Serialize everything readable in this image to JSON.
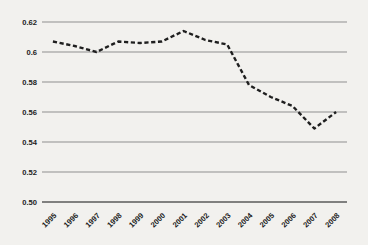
{
  "chart_data": {
    "type": "line",
    "title": "",
    "xlabel": "",
    "ylabel": "",
    "categories": [
      "1995",
      "1996",
      "1997",
      "1998",
      "1999",
      "2000",
      "2001",
      "2002",
      "2003",
      "2004",
      "2005",
      "2006",
      "2007",
      "2008"
    ],
    "series": [
      {
        "name": "dashed-trend",
        "values": [
          0.607,
          0.604,
          0.6,
          0.607,
          0.606,
          0.607,
          0.614,
          0.608,
          0.605,
          0.578,
          0.57,
          0.564,
          0.549,
          0.56
        ]
      }
    ],
    "ylim": [
      0.5,
      0.62
    ],
    "y_ticks": [
      {
        "value": 0.62,
        "label": "0.62"
      },
      {
        "value": 0.6,
        "label": "0.6"
      },
      {
        "value": 0.58,
        "label": "0.58"
      },
      {
        "value": 0.56,
        "label": "0.56"
      },
      {
        "value": 0.54,
        "label": "0.54"
      },
      {
        "value": 0.52,
        "label": "0.52"
      },
      {
        "value": 0.5,
        "label": "0.50"
      }
    ],
    "grid": "horizontal",
    "legend": "none",
    "line_style": "dashed",
    "x_tick_rotation": -45,
    "colors": {
      "line": "#1f1f1f",
      "gridline": "#8f8f8f",
      "baseline": "#5a5a5a",
      "background": "#f2f1ee",
      "tick_text": "#1c1c1c"
    }
  }
}
